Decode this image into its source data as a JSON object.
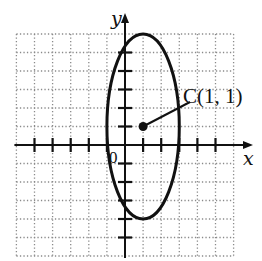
{
  "figure": {
    "type": "ellipse-on-grid",
    "grid": {
      "x_range": [
        -6,
        6
      ],
      "y_range": [
        -6,
        6
      ],
      "step": 1,
      "style": "dotted"
    },
    "axes": {
      "x_label": "x",
      "y_label": "y",
      "origin_label": "0"
    },
    "ellipse": {
      "center": [
        1,
        1
      ],
      "semi_axis_x": 2,
      "semi_axis_y": 5
    },
    "center_point": {
      "label": "C(1, 1)",
      "x": 1,
      "y": 1
    },
    "colors": {
      "ink": "#111111",
      "grid": "#8a8a8a",
      "background": "#ffffff"
    }
  },
  "labels": {
    "x_axis": "x",
    "y_axis": "y",
    "origin": "0",
    "center": "C(1, 1)"
  }
}
